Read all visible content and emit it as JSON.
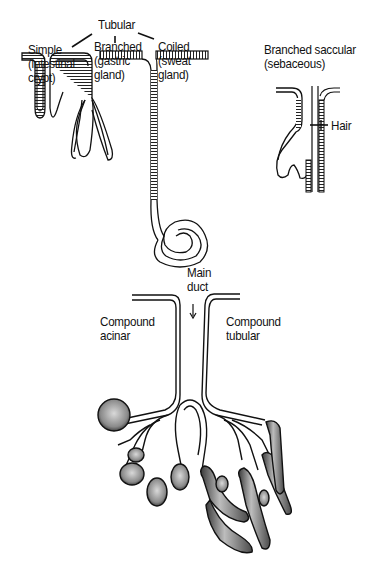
{
  "figure": {
    "type": "gland-classification-diagram",
    "groups": {
      "tubular": {
        "heading": "Tubular",
        "types": [
          {
            "name": "Simple",
            "example_lines": [
              "(intestinal",
              "crypt)"
            ]
          },
          {
            "name": "Branched",
            "example_lines": [
              "(gastric",
              "gland)"
            ]
          },
          {
            "name": "Coiled",
            "example_lines": [
              "(sweat",
              "gland)"
            ]
          }
        ]
      },
      "saccular": {
        "title_lines": [
          "Branched saccular",
          "(sebaceous)"
        ],
        "hair_label": "Hair"
      },
      "compound": {
        "duct_label_lines": [
          "Main",
          "duct"
        ],
        "acinar_lines": [
          "Compound",
          "acinar"
        ],
        "tubular_lines": [
          "Compound",
          "tubular"
        ]
      }
    }
  }
}
